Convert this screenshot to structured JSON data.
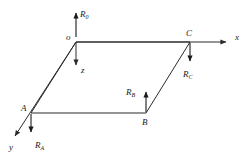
{
  "figure": {
    "kind": "engineering-free-body-diagram",
    "background_color": "#ffffff",
    "line_color": "#2b2b2b",
    "label_color": "#1a1a1a"
  },
  "points": {
    "o": {
      "label": "o",
      "x": 76,
      "y": 42
    },
    "C": {
      "label": "C",
      "x": 190,
      "y": 42
    },
    "B": {
      "label": "B",
      "x": 146,
      "y": 113
    },
    "A": {
      "label": "A",
      "x": 31,
      "y": 113
    }
  },
  "axes": [
    {
      "name": "x-axis",
      "label": "x",
      "direction": "right",
      "tip_x": 229,
      "tip_y": 42,
      "label_x": 236,
      "label_y": 40
    },
    {
      "name": "y-axis",
      "label": "y",
      "direction": "down-left",
      "tip_x": 12,
      "tip_y": 139,
      "label_x": 10,
      "label_y": 149
    },
    {
      "name": "z-axis",
      "label": "z",
      "direction": "down",
      "tip_x": 76,
      "tip_y": 68,
      "label_x": 81,
      "label_y": 72
    }
  ],
  "forces": [
    {
      "name": "reaction-at-o",
      "label": "R",
      "subscript": "0",
      "at_point": "o",
      "direction": "up",
      "tail_x": 76,
      "tail_y": 37,
      "tip_x": 76,
      "tip_y": 10,
      "label_x": 80,
      "label_y": 15
    },
    {
      "name": "reaction-at-C",
      "label": "R",
      "subscript": "C",
      "at_point": "C",
      "direction": "down",
      "tail_x": 190,
      "tail_y": 43,
      "tip_x": 190,
      "tip_y": 64,
      "label_x": 184,
      "label_y": 76
    },
    {
      "name": "reaction-at-B",
      "label": "R",
      "subscript": "B",
      "at_point": "B",
      "direction": "up",
      "tail_x": 146,
      "tail_y": 112,
      "tip_x": 146,
      "tip_y": 89,
      "label_x": 127,
      "label_y": 93
    },
    {
      "name": "reaction-at-A",
      "label": "R",
      "subscript": "A",
      "at_point": "A",
      "direction": "down",
      "tail_x": 31,
      "tail_y": 114,
      "tip_x": 31,
      "tip_y": 135,
      "label_x": 35,
      "label_y": 147
    }
  ],
  "plate": {
    "name": "rectangular-plate",
    "vertices": "76,42 190,42 146,113 31,113"
  }
}
